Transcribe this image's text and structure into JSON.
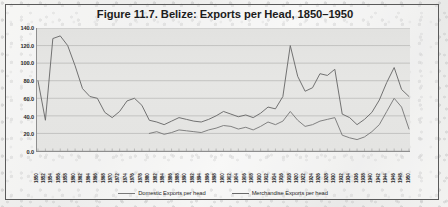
{
  "figure": {
    "title": "Figure 11.7. Belize: Exports per Head, 1850–1950"
  },
  "legend": {
    "items": [
      {
        "label": "Domestic Exports per head",
        "color": "#7a7a7a"
      },
      {
        "label": "Merchandise Exports per head",
        "color": "#6a6a6a"
      }
    ]
  },
  "chart_data": {
    "type": "line",
    "title": "Figure 11.7. Belize: Exports per Head, 1850–1950",
    "xlabel": "",
    "ylabel": "",
    "ylim": [
      0,
      140
    ],
    "yticks": [
      "0.0",
      "20.0",
      "40.0",
      "60.0",
      "80.0",
      "100.0",
      "120.0",
      "140.0"
    ],
    "grid": true,
    "legend_position": "bottom",
    "x": [
      1850,
      1852,
      1854,
      1856,
      1858,
      1860,
      1862,
      1864,
      1866,
      1868,
      1870,
      1872,
      1874,
      1876,
      1878,
      1880,
      1882,
      1884,
      1886,
      1888,
      1890,
      1892,
      1894,
      1896,
      1898,
      1900,
      1902,
      1904,
      1906,
      1908,
      1910,
      1912,
      1914,
      1916,
      1918,
      1920,
      1922,
      1924,
      1926,
      1928,
      1930,
      1932,
      1934,
      1936,
      1938,
      1940,
      1942,
      1944,
      1946,
      1948,
      1950
    ],
    "tick_labels": [
      "1850",
      "1852",
      "1854",
      "1856",
      "1858",
      "1860",
      "1862",
      "1864",
      "1866",
      "1868",
      "1870",
      "1872",
      "1874",
      "1876",
      "1878",
      "1880",
      "1882",
      "1884",
      "1886",
      "1888",
      "1890",
      "1892",
      "1894",
      "1896",
      "1898",
      "1900",
      "1902",
      "1904",
      "1906",
      "1908",
      "1910",
      "1912",
      "1914",
      "1916",
      "1918",
      "1920",
      "1922",
      "1924",
      "1926",
      "1928",
      "1930",
      "1932",
      "1934",
      "1936",
      "1938",
      "1940",
      "1942",
      "1944",
      "1946",
      "1948",
      "1950"
    ],
    "series": [
      {
        "name": "Merchandise Exports per head",
        "color": "#6a6a6a",
        "values": [
          80,
          35,
          128,
          131,
          120,
          97,
          71,
          62,
          60,
          44,
          38,
          45,
          57,
          60,
          52,
          35,
          33,
          30,
          34,
          38,
          36,
          34,
          33,
          36,
          40,
          45,
          42,
          39,
          41,
          38,
          43,
          50,
          48,
          62,
          120,
          85,
          68,
          72,
          88,
          86,
          93,
          42,
          38,
          30,
          36,
          44,
          58,
          78,
          95,
          70,
          62
        ]
      },
      {
        "name": "Domestic Exports per head",
        "color": "#7a7a7a",
        "values": [
          null,
          null,
          null,
          null,
          null,
          null,
          null,
          null,
          null,
          null,
          null,
          null,
          null,
          null,
          null,
          20,
          22,
          19,
          21,
          24,
          23,
          22,
          21,
          24,
          26,
          29,
          28,
          25,
          27,
          24,
          28,
          33,
          30,
          34,
          45,
          35,
          28,
          30,
          34,
          36,
          38,
          18,
          15,
          13,
          16,
          22,
          30,
          45,
          60,
          50,
          25
        ]
      }
    ]
  }
}
